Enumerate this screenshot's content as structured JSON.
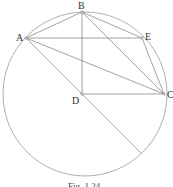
{
  "figure": {
    "caption": "Fig. 1.24",
    "points": [
      {
        "id": "A",
        "label": "A"
      },
      {
        "id": "B",
        "label": "B"
      },
      {
        "id": "C",
        "label": "C"
      },
      {
        "id": "D",
        "label": "D"
      },
      {
        "id": "E",
        "label": "E"
      }
    ],
    "segments": [
      [
        "A",
        "B"
      ],
      [
        "B",
        "E"
      ],
      [
        "A",
        "E"
      ],
      [
        "B",
        "C"
      ],
      [
        "E",
        "C"
      ],
      [
        "A",
        "C"
      ],
      [
        "B",
        "D"
      ],
      [
        "D",
        "C"
      ],
      [
        "A",
        "D-extended"
      ]
    ],
    "shapes": [
      "circumscribed-circle"
    ]
  }
}
